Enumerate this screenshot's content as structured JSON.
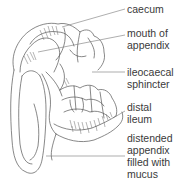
{
  "diagram": {
    "labels": [
      {
        "id": "caecum",
        "text": "caecum"
      },
      {
        "id": "mouth-of-appendix",
        "text": "mouth of\nappendix"
      },
      {
        "id": "ileocaecal-sphincter",
        "text": "ileocaecal\nsphincter"
      },
      {
        "id": "distal-ileum",
        "text": "distal\nileum"
      },
      {
        "id": "distended-appendix",
        "text": "distended\nappendix\nfilled with\nmucus"
      }
    ],
    "colors": {
      "line": "#555555",
      "shading": "#6a6a6a",
      "text": "#3a3a3a",
      "background": "#ffffff"
    }
  }
}
